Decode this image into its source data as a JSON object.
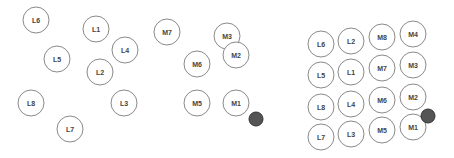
{
  "diagram": {
    "panels": [
      {
        "name": "scattered-layout",
        "nodes": [
          "L6",
          "L1",
          "L4",
          "L5",
          "L2",
          "L8",
          "L3",
          "L7",
          "M7",
          "M3",
          "M2",
          "M6",
          "M5",
          "M1"
        ],
        "marker_near": "M1"
      },
      {
        "name": "grid-layout",
        "columns": [
          [
            "L6",
            "L5",
            "L8",
            "L7"
          ],
          [
            "L2",
            "L1",
            "L4",
            "L3"
          ],
          [
            "M8",
            "M7",
            "M6",
            "M5"
          ],
          [
            "M4",
            "M3",
            "M2",
            "M1"
          ]
        ],
        "marker_near": "M1"
      }
    ],
    "colors": {
      "node_stroke": "#8a8a8a",
      "node_fill": "#ffffff",
      "label": "#444444",
      "marker": "#555555"
    }
  }
}
